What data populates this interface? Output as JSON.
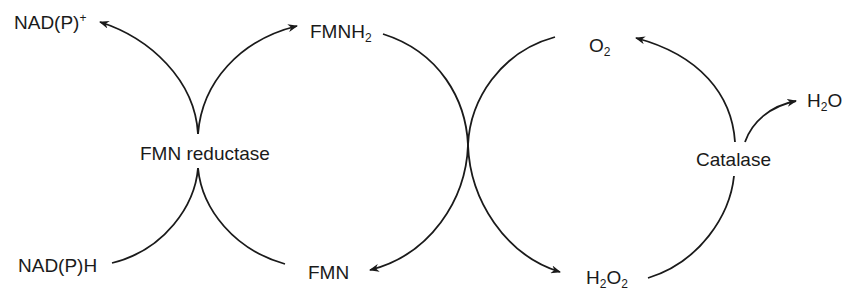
{
  "diagram": {
    "type": "biochemical-coupled-cycles",
    "stroke_color": "#1a1a1a",
    "background": "#ffffff",
    "nodes": {
      "nadp_plus": {
        "base": "NAD(P)",
        "sup": "+"
      },
      "nadph": {
        "text": "NAD(P)H"
      },
      "fmnh2": {
        "base": "FMNH",
        "sub": "2"
      },
      "fmn": {
        "text": "FMN"
      },
      "o2": {
        "base": "O",
        "sub": "2"
      },
      "h2o2": {
        "base1": "H",
        "sub1": "2",
        "base2": "O",
        "sub2": "2"
      },
      "h2o": {
        "base1": "H",
        "sub1": "2",
        "base2": "O"
      }
    },
    "enzymes": {
      "fmn_reductase": "FMN reductase",
      "catalase": "Catalase"
    },
    "edges": [
      {
        "from": "NAD(P)H",
        "to": "NAD(P)+",
        "via": "FMN reductase"
      },
      {
        "from": "FMN",
        "to": "FMNH2",
        "via": "FMN reductase"
      },
      {
        "from": "FMNH2",
        "to": "FMN",
        "via": "coupled crossing"
      },
      {
        "from": "O2",
        "to": "H2O2",
        "via": "coupled crossing"
      },
      {
        "from": "H2O2",
        "to": "O2",
        "via": "Catalase"
      },
      {
        "from": "H2O2",
        "to": "H2O",
        "via": "Catalase"
      }
    ]
  }
}
